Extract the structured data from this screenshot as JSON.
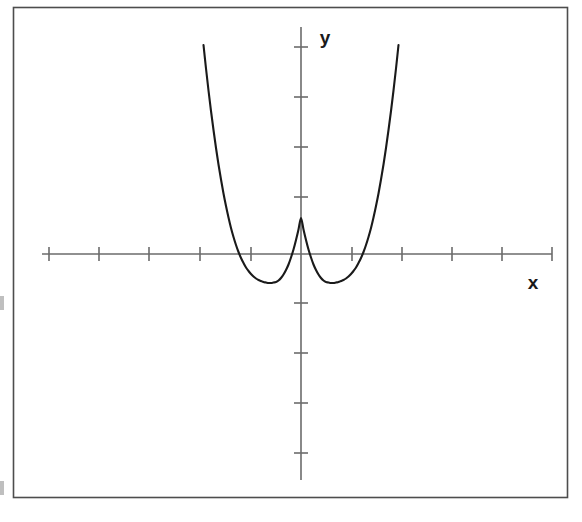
{
  "figure": {
    "frame": {
      "x": 13,
      "y": 7,
      "width": 554,
      "height": 490,
      "stroke_color": "#4d4d4d",
      "fill_color": "#ffffff"
    },
    "axes": {
      "x_axis_label": "x",
      "y_axis_label": "y",
      "origin_px": {
        "x": 301,
        "y": 254
      },
      "pixels_per_unit": {
        "x": 50,
        "y": 50
      },
      "axis_color": "#6b6b6b",
      "tick_color": "#6b6b6b",
      "x_axis_px": {
        "start": 42,
        "end": 552
      },
      "y_axis_px": {
        "top": 27,
        "bottom": 480
      },
      "x_tick_positions_px": [
        49,
        99,
        149,
        200,
        251,
        352,
        402,
        452,
        502,
        552
      ],
      "y_tick_positions_px": [
        47,
        97,
        147,
        197,
        303,
        353,
        403,
        453
      ],
      "tick_half_length_px": 7
    },
    "curve": {
      "stroke_color": "#1a1a1a",
      "stroke_width": 2.1
    }
  },
  "chart_data": {
    "type": "line",
    "title": "",
    "xlabel": "x",
    "ylabel": "y",
    "grid": false,
    "legend": null,
    "xlim": [
      -5.2,
      5.0
    ],
    "ylim": [
      -4.6,
      4.5
    ],
    "x_tick_values": [
      -5,
      -4,
      -3,
      -2,
      -1,
      1,
      2,
      3,
      4,
      5
    ],
    "y_tick_values": [
      4,
      3,
      2,
      1,
      -1,
      -2,
      -3,
      -4
    ],
    "tick_labels_shown": false,
    "features": {
      "local_maximum": {
        "x": 0,
        "y": 1.05
      },
      "local_minima": [
        {
          "x": -0.62,
          "y": -1.32
        },
        {
          "x": 0.62,
          "y": -1.32
        }
      ],
      "x_intercepts": [
        -1.67,
        -0.72,
        0.72,
        1.67
      ],
      "y_intercept": 1.05,
      "end_behavior": "up on the left, up on the right"
    },
    "series": [
      {
        "name": "quartic",
        "x": [
          -1.95,
          -1.9,
          -1.85,
          -1.8,
          -1.75,
          -1.7,
          -1.65,
          -1.6,
          -1.55,
          -1.5,
          -1.45,
          -1.4,
          -1.35,
          -1.3,
          -1.25,
          -1.2,
          -1.15,
          -1.1,
          -1.05,
          -1.0,
          -0.95,
          -0.9,
          -0.85,
          -0.8,
          -0.75,
          -0.7,
          -0.65,
          -0.6,
          -0.55,
          -0.5,
          -0.45,
          -0.4,
          -0.35,
          -0.3,
          -0.25,
          -0.2,
          -0.15,
          -0.1,
          -0.05,
          0.0,
          0.05,
          0.1,
          0.15,
          0.2,
          0.25,
          0.3,
          0.35,
          0.4,
          0.45,
          0.5,
          0.55,
          0.6,
          0.65,
          0.7,
          0.75,
          0.8,
          0.85,
          0.9,
          0.95,
          1.0,
          1.05,
          1.1,
          1.15,
          1.2,
          1.25,
          1.3,
          1.35,
          1.4,
          1.45,
          1.5,
          1.55,
          1.6,
          1.65,
          1.7,
          1.75,
          1.8,
          1.85,
          1.9,
          1.95
        ],
        "y": [
          4.18,
          3.71,
          3.27,
          2.86,
          2.48,
          2.12,
          1.79,
          1.49,
          1.21,
          0.96,
          0.73,
          0.52,
          0.34,
          0.18,
          0.04,
          -0.08,
          -0.18,
          -0.27,
          -0.34,
          -0.4,
          -0.45,
          -0.49,
          -0.52,
          -0.54,
          -0.56,
          -0.57,
          -0.58,
          -0.58,
          -0.57,
          -0.56,
          -0.53,
          -0.48,
          -0.41,
          -0.32,
          -0.21,
          -0.07,
          0.09,
          0.28,
          0.49,
          0.72,
          0.49,
          0.28,
          0.09,
          -0.07,
          -0.21,
          -0.32,
          -0.41,
          -0.48,
          -0.53,
          -0.56,
          -0.57,
          -0.58,
          -0.58,
          -0.57,
          -0.56,
          -0.54,
          -0.52,
          -0.49,
          -0.45,
          -0.4,
          -0.34,
          -0.27,
          -0.18,
          -0.08,
          0.04,
          0.18,
          0.34,
          0.52,
          0.73,
          0.96,
          1.21,
          1.49,
          1.79,
          2.12,
          2.48,
          2.86,
          3.27,
          3.71,
          4.18
        ]
      }
    ]
  }
}
